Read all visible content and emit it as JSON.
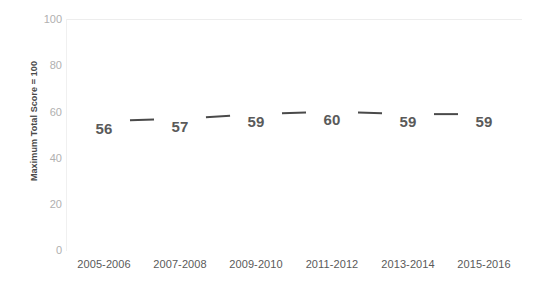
{
  "chart_data": {
    "type": "line",
    "title": "",
    "subtitle": "",
    "xlabel": "",
    "ylabel": "Maximum Total Score = 100",
    "categories": [
      "2005-2006",
      "2007-2008",
      "2009-2010",
      "2011-2012",
      "2013-2014",
      "2015-2016"
    ],
    "values": [
      56,
      57,
      59,
      60,
      59,
      59
    ],
    "data_labels": [
      "56",
      "57",
      "59",
      "60",
      "59",
      "59"
    ],
    "series": [
      {
        "name": "",
        "values": [
          56,
          57,
          59,
          60,
          59,
          59
        ]
      }
    ],
    "ylim": [
      0,
      100
    ],
    "yticks": [
      100,
      80,
      60,
      40,
      20,
      0
    ],
    "ytick_labels": [
      "100",
      "80",
      "60",
      "40",
      "20",
      "0"
    ],
    "grid": "top-border-only",
    "legend": "none",
    "line_color": "#4a4a4a",
    "label_color": "#5a5a5a",
    "axis_text_color": "#b0b0b0",
    "gridline_color": "#ededed",
    "background_color": "#ffffff"
  }
}
